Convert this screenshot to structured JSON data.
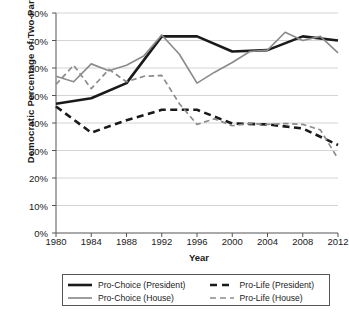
{
  "chart_data": {
    "type": "line",
    "title": "",
    "xlabel": "Year",
    "ylabel": "Democratic Percentage of Two-Party Vote",
    "xlim": [
      1980,
      2012
    ],
    "ylim": [
      0,
      80
    ],
    "ytick_labels": [
      "0%",
      "10%",
      "20%",
      "30%",
      "40%",
      "50%",
      "60%",
      "70%",
      "80%"
    ],
    "ytick_values": [
      0,
      10,
      20,
      30,
      40,
      50,
      60,
      70,
      80
    ],
    "xtick_labels": [
      "1980",
      "1984",
      "1988",
      "1992",
      "1996",
      "2000",
      "2004",
      "2008",
      "2012"
    ],
    "xtick_values": [
      1980,
      1984,
      1988,
      1992,
      1996,
      2000,
      2004,
      2008,
      2012
    ],
    "grid": "horizontal",
    "legend_position": "bottom",
    "series": [
      {
        "name": "Pro-Choice (President)",
        "style": "solid",
        "color": "#1a1a1a",
        "width": 2.6,
        "x": [
          1980,
          1984,
          1988,
          1992,
          1996,
          2000,
          2004,
          2008,
          2012
        ],
        "values": [
          47.0,
          49.0,
          54.5,
          71.5,
          71.5,
          66.0,
          66.5,
          71.5,
          70.0
        ]
      },
      {
        "name": "Pro-Life (President)",
        "style": "dashed",
        "color": "#1a1a1a",
        "width": 2.6,
        "x": [
          1980,
          1984,
          1988,
          1992,
          1996,
          2000,
          2004,
          2008,
          2012
        ],
        "values": [
          46.0,
          36.5,
          41.0,
          44.8,
          44.8,
          39.8,
          39.5,
          38.0,
          32.0
        ]
      },
      {
        "name": "Pro-Choice (House)",
        "style": "solid",
        "color": "#8c8c8c",
        "width": 1.7,
        "x": [
          1980,
          1982,
          1984,
          1986,
          1988,
          1990,
          1992,
          1994,
          1996,
          1998,
          2000,
          2002,
          2004,
          2006,
          2008,
          2010,
          2012
        ],
        "values": [
          57.0,
          55.0,
          61.5,
          59.0,
          61.0,
          64.5,
          72.0,
          65.0,
          54.5,
          58.5,
          62.0,
          66.0,
          66.5,
          73.0,
          70.0,
          71.5,
          65.5
        ]
      },
      {
        "name": "Pro-Life (House)",
        "style": "dashed",
        "color": "#8c8c8c",
        "width": 1.7,
        "x": [
          1980,
          1982,
          1984,
          1986,
          1988,
          1990,
          1992,
          1994,
          1996,
          1998,
          2000,
          2002,
          2004,
          2006,
          2008,
          2010,
          2012
        ],
        "values": [
          54.0,
          61.0,
          52.5,
          59.5,
          55.0,
          57.0,
          57.3,
          47.0,
          39.5,
          41.5,
          39.0,
          39.8,
          39.5,
          39.8,
          39.5,
          37.5,
          27.0
        ]
      }
    ]
  },
  "legend": {
    "entries": [
      {
        "label": "Pro-Choice (President)",
        "style": "solid",
        "color": "#1a1a1a"
      },
      {
        "label": "Pro-Life (President)",
        "style": "dashed",
        "color": "#1a1a1a"
      },
      {
        "label": "Pro-Choice (House)",
        "style": "solid",
        "color": "#8c8c8c"
      },
      {
        "label": "Pro-Life (House)",
        "style": "dashed",
        "color": "#8c8c8c"
      }
    ]
  }
}
